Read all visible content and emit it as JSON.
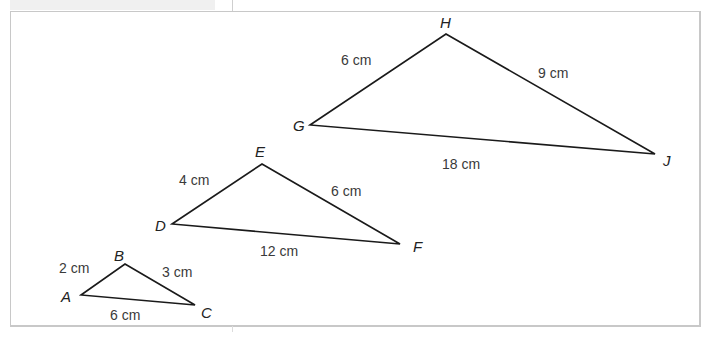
{
  "figure": {
    "triangles": [
      {
        "name": "ABC",
        "vertices": {
          "A": [
            81,
            295
          ],
          "B": [
            125,
            264
          ],
          "C": [
            195,
            305
          ]
        },
        "vertex_labels": {
          "A": "A",
          "B": "B",
          "C": "C"
        },
        "sides": {
          "AB": "2 cm",
          "BC": "3 cm",
          "AC": "6 cm"
        }
      },
      {
        "name": "DEF",
        "vertices": {
          "D": [
            172,
            224
          ],
          "E": [
            262,
            164
          ],
          "F": [
            400,
            244
          ]
        },
        "vertex_labels": {
          "D": "D",
          "E": "E",
          "F": "F"
        },
        "sides": {
          "DE": "4 cm",
          "EF": "6 cm",
          "DF": "12 cm"
        }
      },
      {
        "name": "GHJ",
        "vertices": {
          "G": [
            310,
            125
          ],
          "H": [
            446,
            34
          ],
          "J": [
            655,
            154
          ]
        },
        "vertex_labels": {
          "G": "G",
          "H": "H",
          "J": "J"
        },
        "sides": {
          "GH": "6 cm",
          "HJ": "9 cm",
          "GJ": "18 cm"
        }
      }
    ]
  },
  "colors": {
    "stroke": "#1a1a1a",
    "frame": "#c8c8c8",
    "text": "#3a3a3a"
  }
}
